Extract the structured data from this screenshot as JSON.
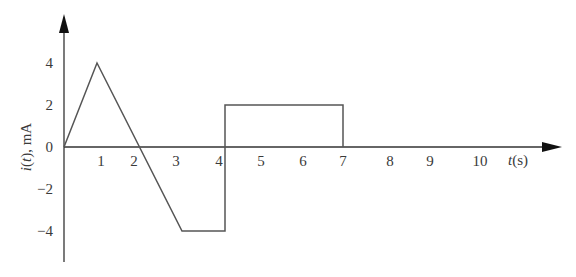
{
  "chart_data": {
    "type": "line",
    "title": "",
    "xlabel": "t(s)",
    "xlabel_var": "t",
    "xlabel_unit": "(s)",
    "ylabel": "i(t), mA",
    "ylabel_var": "i",
    "ylabel_arg": "(t)",
    "ylabel_unit": ", mA",
    "x_ticks": [
      1,
      2,
      3,
      4,
      5,
      6,
      7,
      8,
      9,
      10
    ],
    "y_ticks": [
      4,
      2,
      0,
      -2,
      -4
    ],
    "xlim": [
      0,
      11
    ],
    "ylim": [
      -5,
      5
    ],
    "grid": false,
    "legend": null,
    "series": [
      {
        "name": "i(t)",
        "x": [
          0,
          1,
          3,
          4,
          4,
          7,
          7
        ],
        "y": [
          0,
          4,
          -4,
          -4,
          2,
          2,
          0
        ]
      }
    ],
    "line_color": "#555555",
    "axis_color": "#222222"
  }
}
